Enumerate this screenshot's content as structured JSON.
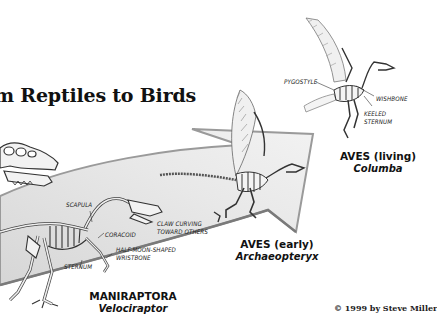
{
  "title": "m Reptiles to Birds",
  "stages": [
    {
      "group": "MANIRAPTORA",
      "genus": "Velociraptor",
      "labels": [
        "SCAPULA",
        "CORACOID",
        "HALF-MOON-SHAPED WRISTBONE",
        "STERNUM"
      ]
    },
    {
      "group": "AVES (early)",
      "genus": "Archaeopteryx",
      "labels": [
        "CLAW CURVING TOWARD OTHERS"
      ]
    },
    {
      "group": "AVES (living)",
      "genus": "Columba",
      "labels": [
        "PYGOSTYLE",
        "WISHBONE",
        "KEELED STERNUM"
      ]
    }
  ],
  "labels": {
    "scapula": "SCAPULA",
    "coracoid": "CORACOID",
    "wristbone_1": "HALF-MOON-SHAPED",
    "wristbone_2": "WRISTBONE",
    "sternum": "STERNUM",
    "claw_1": "CLAW CURVING",
    "claw_2": "TOWARD OTHERS",
    "pygostyle": "PYGOSTYLE",
    "wishbone": "WISHBONE",
    "keeled_1": "KEELED",
    "keeled_2": "STERNUM"
  },
  "taxa": {
    "maniraptora": {
      "group": "MANIRAPTORA",
      "genus": "Velociraptor"
    },
    "aves_early": {
      "group": "AVES (early)",
      "genus": "Archaeopteryx"
    },
    "aves_living": {
      "group": "AVES (living)",
      "genus": "Columba"
    }
  },
  "copyright": "© 1999 by Steve Miller",
  "colors": {
    "arrow_fill": "#e4e4e4",
    "arrow_edge": "#9a9a9a",
    "bone": "#f4f4f4",
    "bone_line": "#333333",
    "text": "#111111"
  }
}
